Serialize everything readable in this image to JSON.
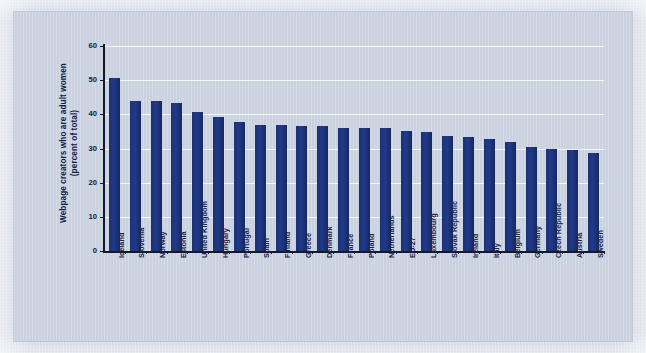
{
  "chart_data": {
    "type": "bar",
    "title": "",
    "subtitle": "",
    "xlabel": "",
    "ylabel": "Webpage creators who are adult women (percent of total)",
    "ylabel_lines": [
      "Webpage creators who are adult women",
      "(percent of total)"
    ],
    "ylim": [
      0,
      60
    ],
    "yticks": [
      0,
      10,
      20,
      30,
      40,
      50,
      60
    ],
    "ytick_labels": [
      "0",
      "10",
      "20",
      "30",
      "40",
      "50",
      "60"
    ],
    "grid": "horizontal",
    "legend": "none",
    "bar_color": "#1c3477",
    "plot_background": "#ccd3e1",
    "figure_background": "#cfd6e4",
    "gridline_color": "#f4f6fa",
    "axis_color": "#14182b",
    "categories": [
      "Iceland",
      "Slovenia",
      "Norway",
      "Estonia",
      "United Kingdom",
      "Hungary",
      "Portugal",
      "Spain",
      "Finland",
      "Greece",
      "Denmark",
      "France",
      "Poland",
      "Netherlands",
      "EU-27",
      "Luxembourg",
      "Slovak Republic",
      "Ireland",
      "Italy",
      "Belgium",
      "Germany",
      "Czech Republic",
      "Austria",
      "Sweden"
    ],
    "values": [
      50.7,
      43.9,
      43.9,
      43.3,
      40.8,
      39.1,
      37.7,
      37.0,
      36.8,
      36.7,
      36.6,
      36.1,
      36.0,
      35.9,
      35.1,
      34.9,
      33.8,
      33.5,
      32.8,
      31.9,
      30.6,
      29.8,
      29.6,
      28.8
    ]
  }
}
